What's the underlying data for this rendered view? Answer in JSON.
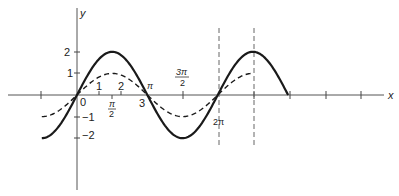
{
  "chart_data": {
    "type": "line",
    "title": "",
    "xlabel": "x",
    "ylabel": "y",
    "xlim": [
      -1.5708,
      12.566
    ],
    "ylim": [
      -3.6,
      3.9
    ],
    "grid": false,
    "legend": null,
    "series": [
      {
        "name": "2 sin x",
        "style": "solid",
        "expression": "y = 2 sin x",
        "x_range": [
          -1.5708,
          9.4248
        ],
        "x": [
          -1.5708,
          0,
          1.5708,
          3.1416,
          4.7124,
          6.2832,
          7.854,
          9.4248
        ],
        "values": [
          -2,
          0,
          2,
          0,
          -2,
          0,
          2,
          0
        ]
      },
      {
        "name": "sin x",
        "style": "dashed",
        "expression": "y = sin x",
        "x_range": [
          -1.5708,
          7.854
        ],
        "x": [
          -1.5708,
          0,
          1.5708,
          3.1416,
          4.7124,
          6.2832,
          7.854
        ],
        "values": [
          -1,
          0,
          1,
          0,
          -1,
          0,
          1
        ]
      }
    ],
    "x_tick_labels": [
      {
        "value": 0,
        "label": "0"
      },
      {
        "value": 1,
        "label": "1"
      },
      {
        "value": 2,
        "label": "2"
      },
      {
        "value": 1.5708,
        "label": "π/2"
      },
      {
        "value": 3,
        "label": "3"
      },
      {
        "value": 3.1416,
        "label": "π"
      },
      {
        "value": 4.7124,
        "label": "3π/2"
      },
      {
        "value": 6.2832,
        "label": "2π"
      }
    ],
    "y_tick_labels": [
      {
        "value": 2,
        "label": "2"
      },
      {
        "value": 1,
        "label": "1"
      },
      {
        "value": -1,
        "label": "−1"
      },
      {
        "value": -2,
        "label": "−2"
      }
    ],
    "annotations": [
      "vertical dashed line at x = 2π",
      "vertical dashed line at x = 5π/2"
    ]
  },
  "labels": {
    "x_axis": "x",
    "y_axis": "y",
    "origin": "0",
    "one": "1",
    "two": "2",
    "three": "3",
    "pi": "π",
    "pi_over_2_num": "π",
    "pi_over_2_den": "2",
    "three_pi_over_2_num": "3π",
    "three_pi_over_2_den": "2",
    "two_pi": "2π",
    "y_pos2": "2",
    "y_pos1": "1",
    "y_neg1": "−1",
    "y_neg2": "−2"
  }
}
